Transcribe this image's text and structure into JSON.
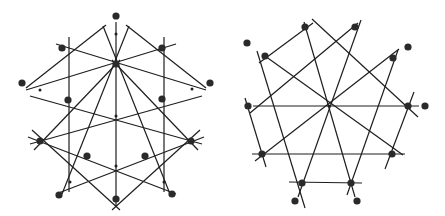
{
  "figures": [
    {
      "id": "left",
      "description": "Octagonal star arrangement of lines with marked points",
      "center": [
        116,
        116
      ],
      "lines": [
        [
          [
            116,
            22
          ],
          [
            116,
            206
          ]
        ],
        [
          [
            69,
            37
          ],
          [
            69,
            192
          ]
        ],
        [
          [
            164,
            37
          ],
          [
            164,
            192
          ]
        ],
        [
          [
            106,
            25
          ],
          [
            26,
            88
          ]
        ],
        [
          [
            126,
            25
          ],
          [
            206,
            88
          ]
        ],
        [
          [
            103,
            26
          ],
          [
            170,
            194
          ]
        ],
        [
          [
            129,
            26
          ],
          [
            62,
            194
          ]
        ],
        [
          [
            56,
            44
          ],
          [
            206,
            90
          ]
        ],
        [
          [
            176,
            44
          ],
          [
            26,
            90
          ]
        ],
        [
          [
            30,
            96
          ],
          [
            202,
            144
          ]
        ],
        [
          [
            202,
            96
          ],
          [
            30,
            144
          ]
        ],
        [
          [
            28,
            137
          ],
          [
            176,
            194
          ]
        ],
        [
          [
            204,
            137
          ],
          [
            56,
            194
          ]
        ],
        [
          [
            34,
            150
          ],
          [
            120,
            60
          ]
        ],
        [
          [
            198,
            150
          ],
          [
            112,
            60
          ]
        ],
        [
          [
            32,
            130
          ],
          [
            120,
            210
          ]
        ],
        [
          [
            200,
            130
          ],
          [
            112,
            210
          ]
        ]
      ],
      "big_points": [
        [
          116,
          16
        ],
        [
          62,
          48
        ],
        [
          162,
          48
        ],
        [
          116,
          64
        ],
        [
          22,
          83
        ],
        [
          210,
          83
        ],
        [
          68,
          100
        ],
        [
          162,
          99
        ],
        [
          40,
          141
        ],
        [
          191,
          141
        ],
        [
          87,
          156
        ],
        [
          145,
          156
        ],
        [
          59,
          195
        ],
        [
          172,
          194
        ],
        [
          116,
          199
        ]
      ],
      "small_points": [
        [
          116,
          34
        ],
        [
          40,
          90
        ],
        [
          192,
          89
        ],
        [
          116,
          116
        ],
        [
          116,
          166
        ],
        [
          70,
          182
        ],
        [
          164,
          182
        ]
      ]
    },
    {
      "id": "right",
      "description": "Decagonal arrangement of lines with marked points",
      "center": [
        329,
        106
      ],
      "lines": [
        [
          [
            253,
            106
          ],
          [
            419,
            106
          ]
        ],
        [
          [
            252,
            154
          ],
          [
            405,
            154
          ]
        ],
        [
          [
            289,
            182
          ],
          [
            362,
            183
          ]
        ],
        [
          [
            259,
            63
          ],
          [
            313,
            23
          ]
        ],
        [
          [
            312,
            19
          ],
          [
            418,
            117
          ]
        ],
        [
          [
            257,
            51
          ],
          [
            305,
            208
          ]
        ],
        [
          [
            304,
            22
          ],
          [
            355,
            197
          ]
        ],
        [
          [
            361,
            20
          ],
          [
            298,
            197
          ]
        ],
        [
          [
            358,
            23
          ],
          [
            250,
            113
          ]
        ],
        [
          [
            265,
            56
          ],
          [
            403,
            155
          ]
        ],
        [
          [
            399,
            49
          ],
          [
            255,
            161
          ]
        ],
        [
          [
            398,
            50
          ],
          [
            347,
            195
          ]
        ],
        [
          [
            414,
            92
          ],
          [
            385,
            169
          ]
        ],
        [
          [
            245,
            98
          ],
          [
            266,
            167
          ]
        ]
      ],
      "big_points": [
        [
          305,
          27
        ],
        [
          355,
          27
        ],
        [
          265,
          56
        ],
        [
          393,
          58
        ],
        [
          248,
          106
        ],
        [
          408,
          106
        ],
        [
          262,
          154
        ],
        [
          392,
          154
        ],
        [
          302,
          183
        ],
        [
          351,
          183
        ],
        [
          247,
          43
        ],
        [
          408,
          47
        ],
        [
          425,
          106
        ],
        [
          295,
          201
        ],
        [
          357,
          201
        ]
      ],
      "small_points": [
        [
          329,
          106
        ]
      ]
    }
  ],
  "colors": {
    "line": "#1e1e1e",
    "point": "#2a2a2a",
    "background": "#ffffff"
  }
}
